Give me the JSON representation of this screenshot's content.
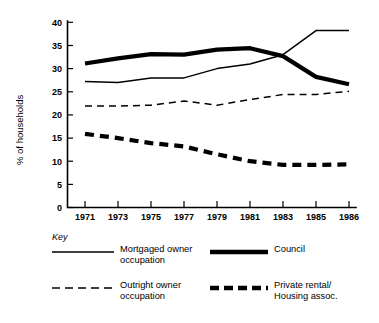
{
  "chart_data": {
    "type": "line",
    "title": "",
    "xlabel": "",
    "ylabel": "% of households",
    "categories": [
      "1971",
      "1973",
      "1975",
      "1977",
      "1979",
      "1981",
      "1983",
      "1985",
      "1986"
    ],
    "x_tick_labels": [
      "1971",
      "1973",
      "1975",
      "1977",
      "1979",
      "1981",
      "1983",
      "1985",
      "1986"
    ],
    "y_tick_labels": [
      "0",
      "5",
      "10",
      "15",
      "20",
      "25",
      "30",
      "35",
      "40"
    ],
    "y_ticks": [
      0,
      5,
      10,
      15,
      20,
      25,
      30,
      35,
      40
    ],
    "ylim": [
      0,
      40
    ],
    "grid": false,
    "legend_position": "below-plot",
    "series": [
      {
        "name": "Mortgaged owner occupation",
        "style": "thin-solid",
        "values": [
          27.2,
          27.0,
          28.0,
          28.0,
          30.0,
          31.0,
          33.0,
          38.2,
          38.2
        ]
      },
      {
        "name": "Council",
        "style": "thick-solid",
        "values": [
          31.1,
          32.2,
          33.1,
          33.0,
          34.1,
          34.4,
          32.7,
          28.2,
          26.6
        ]
      },
      {
        "name": "Outright owner occupation",
        "style": "thin-dashed",
        "values": [
          21.9,
          21.9,
          22.1,
          23.0,
          22.1,
          23.3,
          24.4,
          24.4,
          25.1
        ]
      },
      {
        "name": "Private rental/Housing assoc.",
        "style": "thick-dashed",
        "values": [
          15.9,
          15.0,
          13.9,
          13.2,
          11.5,
          10.0,
          9.2,
          9.2,
          9.3
        ]
      }
    ]
  },
  "axis": {
    "y_title": "% of households"
  },
  "legend": {
    "key_word": "Key",
    "entries": [
      {
        "id": "mortgaged",
        "label": "Mortgaged owner\noccupation",
        "style": "thin-solid"
      },
      {
        "id": "council",
        "label": "Council",
        "style": "thick-solid"
      },
      {
        "id": "outright",
        "label": "Outright owner\noccupation",
        "style": "thin-dashed"
      },
      {
        "id": "private-rental",
        "label": "Private rental/\nHousing assoc.",
        "style": "thick-dashed"
      }
    ]
  },
  "colors": {
    "ink": "#000000",
    "background": "#ffffff"
  }
}
